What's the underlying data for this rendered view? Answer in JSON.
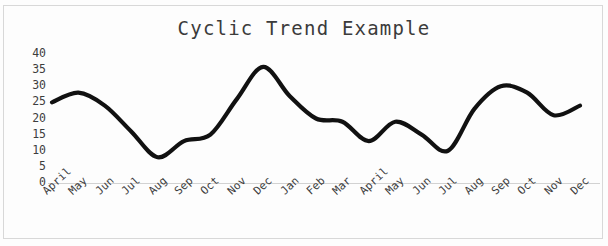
{
  "chart_data": {
    "type": "line",
    "title": "Cyclic Trend Example",
    "xlabel": "",
    "ylabel": "",
    "grid": false,
    "legend": false,
    "ylim": [
      0,
      40
    ],
    "ytick_labels": [
      "40",
      "35",
      "30",
      "25",
      "20",
      "15",
      "10",
      "5",
      "0"
    ],
    "ytick_values": [
      40,
      35,
      30,
      25,
      20,
      15,
      10,
      5,
      0
    ],
    "categories": [
      "April",
      "May",
      "Jun",
      "Jul",
      "Aug",
      "Sep",
      "Oct",
      "Nov",
      "Dec",
      "Jan",
      "Feb",
      "Mar",
      "April",
      "May",
      "Jun",
      "Jul",
      "Aug",
      "Sep",
      "Oct",
      "Nov",
      "Dec"
    ],
    "series": [
      {
        "name": "Trend",
        "color": "#111111",
        "values": [
          25,
          28,
          24,
          16,
          8,
          13,
          15,
          26,
          36,
          27,
          20,
          19,
          13,
          19,
          15,
          10,
          23,
          30,
          28,
          21,
          24
        ]
      }
    ]
  },
  "axes": {
    "y_tick_color": "#3d3d3d",
    "x_tick_color": "#3d3d3d",
    "baseline_color": "#d2d2d2"
  },
  "style": {
    "background": "#fdfdfd",
    "border_color": "#d8d8d8",
    "title_color": "#3b3b3b",
    "line_color": "#111111",
    "line_width": 4.2
  }
}
